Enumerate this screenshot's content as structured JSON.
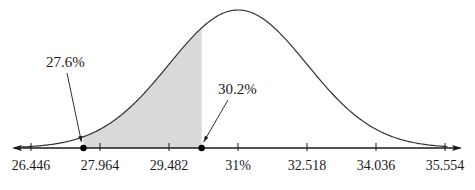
{
  "chart_data": {
    "type": "area",
    "title": "",
    "xlabel": "",
    "ylabel": "",
    "distribution": "normal",
    "mean": 31,
    "std_dev": 1.518,
    "xlim": [
      26.1,
      36.0
    ],
    "tick_values": [
      26.446,
      27.964,
      29.482,
      31,
      32.518,
      34.036,
      35.554
    ],
    "tick_labels": [
      "26.446",
      "27.964",
      "29.482",
      "31%",
      "32.518",
      "34.036",
      "35.554"
    ],
    "shaded_region": {
      "from": 27.6,
      "to": 30.2
    },
    "points": [
      {
        "value": 27.6,
        "label": "27.6%"
      },
      {
        "value": 30.2,
        "label": "30.2%"
      }
    ],
    "grid": false,
    "legend": null
  },
  "colors": {
    "curve": "#333333",
    "axis": "#1a1a1a",
    "shade": "#d9d9d9",
    "point": "#000000"
  }
}
